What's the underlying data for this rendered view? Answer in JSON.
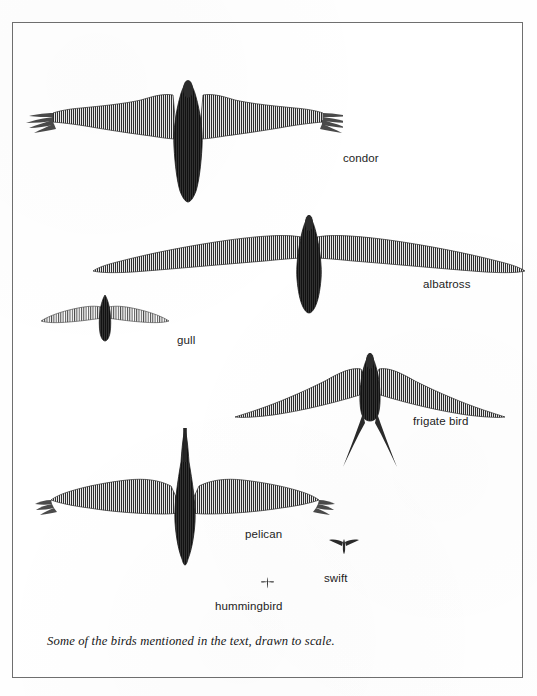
{
  "figure": {
    "caption": "Some of the birds mentioned in the text, drawn to scale.",
    "ink_color": "#3a3a3a",
    "frame_color": "#6c6c6c",
    "paper_color": "#ffffff",
    "label_color": "#1d1d1d"
  },
  "birds": [
    {
      "id": "condor",
      "label": "condor",
      "label_x": 330,
      "label_y": 136,
      "center_x": 222,
      "center_y": 112,
      "wingspan_px": 276,
      "body_length_px": 115,
      "silhouette": "soaring raptor with broad rectangular wings, deeply splayed primary feathers at both wingtips, small head, long wedge tail"
    },
    {
      "id": "albatross",
      "label": "albatross",
      "label_x": 410,
      "label_y": 262,
      "center_x": 300,
      "center_y": 237,
      "wingspan_px": 422,
      "body_length_px": 98,
      "silhouette": "very long narrow pointed wings, short tail, compact body, gliding seabird"
    },
    {
      "id": "gull",
      "label": "gull",
      "label_x": 164,
      "label_y": 318,
      "center_x": 100,
      "center_y": 297,
      "wingspan_px": 118,
      "body_length_px": 46,
      "silhouette": "slender tapering wings with slight elbow bend, small body, short tail"
    },
    {
      "id": "frigate-bird",
      "label": "frigate bird",
      "label_x": 410,
      "label_y": 399,
      "center_x": 362,
      "center_y": 362,
      "wingspan_px": 274,
      "body_length_px": 100,
      "silhouette": "angular crooked wings sharply bent at the wrist, long deeply forked scissor tail"
    },
    {
      "id": "pelican",
      "label": "pelican",
      "label_x": 232,
      "label_y": 512,
      "center_x": 165,
      "center_y": 480,
      "wingspan_px": 250,
      "body_length_px": 110,
      "silhouette": "broad wings with fingered primaries, heavy body, very long straight bill, short tail"
    },
    {
      "id": "swift",
      "label": "swift",
      "label_x": 311,
      "label_y": 556,
      "center_x": 330,
      "center_y": 524,
      "wingspan_px": 28,
      "body_length_px": 11,
      "silhouette": "tiny scythe-shaped swept-back wings"
    },
    {
      "id": "hummingbird",
      "label": "hummingbird",
      "label_x": 212,
      "label_y": 584,
      "center_x": 254,
      "center_y": 559,
      "wingspan_px": 11,
      "body_length_px": 7,
      "silhouette": "minute cross-shaped speck"
    }
  ]
}
